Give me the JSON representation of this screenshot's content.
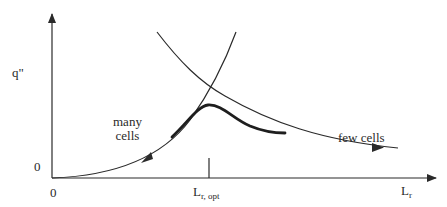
{
  "diagram": {
    "type": "conceptual plot",
    "y_axis": {
      "label": "q\"",
      "origin_label": "0"
    },
    "x_axis": {
      "label_main": "L",
      "label_sub": "r",
      "origin_label": "0",
      "tick": {
        "label_main": "L",
        "label_sub": "r, opt"
      }
    },
    "curves": [
      {
        "name": "many cells",
        "description": "rising curve, arrow pointing toward origin",
        "label_line1": "many",
        "label_line2": "cells"
      },
      {
        "name": "few cells",
        "description": "falling curve, arrow pointing toward large L_r",
        "label": "few cells"
      },
      {
        "name": "resulting heat flux",
        "description": "thick curve with maximum at L_r,opt"
      }
    ],
    "colors": {
      "ink": "#2a2a2a",
      "background": "#ffffff"
    }
  }
}
